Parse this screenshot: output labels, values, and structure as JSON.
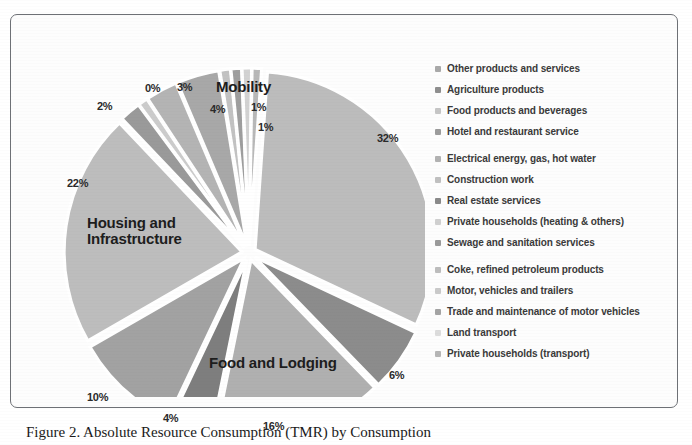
{
  "figure": {
    "caption": "Figure 2. Absolute Resource Consumption (TMR) by Consumption"
  },
  "chart_data": {
    "type": "pie",
    "title": "",
    "exploded": true,
    "center": {
      "x": 224,
      "y": 216
    },
    "radius": 178,
    "labels": [
      "Other products and services",
      "Agriculture products",
      "Food products and beverages",
      "Hotel and restaurant service",
      "Electrical energy, gas, hot water",
      "Construction work",
      "Real estate services",
      "Private households (heating & others)",
      "Sewage and sanitation services",
      "Coke, refined petroleum products",
      "Motor, vehicles and trailers",
      "Trade and maintenance of motor vehicles",
      "Land transport",
      "Private households (transport)"
    ],
    "values": [
      32,
      6,
      16,
      4,
      10,
      22,
      2,
      0,
      3,
      4,
      1,
      1,
      0,
      0
    ],
    "display_percents": [
      "32%",
      "6%",
      "16%",
      "4%",
      "10%",
      "22%",
      "2%",
      "0%",
      "3%",
      "4%",
      "1%",
      "1%"
    ],
    "colors": [
      "#bcbcbc",
      "#8c8c8c",
      "#b0b0b0",
      "#7e7e7e",
      "#a2a2a2",
      "#bdbdbd",
      "#9a9a9a",
      "#cccccc",
      "#b4b4b4",
      "#a8a8a8",
      "#c2c2c2",
      "#9e9e9e",
      "#d2d2d2",
      "#b8b8b8"
    ],
    "group_labels": [
      "Mobility",
      "Housing and Infrastructure",
      "Food and Lodging"
    ],
    "legend_position": "right"
  },
  "pie_labels": [
    {
      "text": "32%",
      "x": 352,
      "y": 95
    },
    {
      "text": "6%",
      "x": 364,
      "y": 332
    },
    {
      "text": "16%",
      "x": 238,
      "y": 383
    },
    {
      "text": "4%",
      "x": 138,
      "y": 375
    },
    {
      "text": "10%",
      "x": 62,
      "y": 354
    },
    {
      "text": "22%",
      "x": 42,
      "y": 140
    },
    {
      "text": "2%",
      "x": 72,
      "y": 63
    },
    {
      "text": "0%",
      "x": 120,
      "y": 45
    },
    {
      "text": "3%",
      "x": 152,
      "y": 44
    },
    {
      "text": "4%",
      "x": 185,
      "y": 66
    },
    {
      "text": "1%",
      "x": 226,
      "y": 64
    },
    {
      "text": "1%",
      "x": 233,
      "y": 84
    }
  ],
  "pie_group_labels": [
    {
      "text": "Mobility",
      "x": 191,
      "y": 42,
      "multiline": false
    },
    {
      "text": "Housing and Infrastructure",
      "x": 62,
      "y": 178,
      "multiline": true
    },
    {
      "text": "Food and Lodging",
      "x": 184,
      "y": 318,
      "multiline": false
    }
  ],
  "legend": {
    "groups": [
      {
        "items": [
          {
            "label": "Other products and services",
            "color": "#a9a9a9"
          },
          {
            "label": "Agriculture products",
            "color": "#8f8f8f"
          },
          {
            "label": "Food products and beverages",
            "color": "#c6c6c6"
          },
          {
            "label": "Hotel and restaurant service",
            "color": "#9c9c9c"
          }
        ]
      },
      {
        "items": [
          {
            "label": "Electrical energy, gas, hot water",
            "color": "#b2b2b2"
          },
          {
            "label": "Construction work",
            "color": "#c0c0c0"
          },
          {
            "label": "Real estate services",
            "color": "#8a8a8a"
          },
          {
            "label": "Private households (heating & others)",
            "color": "#d0d0d0"
          },
          {
            "label": "Sewage and sanitation services",
            "color": "#9a9a9a"
          }
        ]
      },
      {
        "items": [
          {
            "label": "Coke, refined petroleum products",
            "color": "#bdbdbd"
          },
          {
            "label": "Motor, vehicles and trailers",
            "color": "#cacaca"
          },
          {
            "label": "Trade and maintenance of motor vehicles",
            "color": "#a4a4a4"
          },
          {
            "label": "Land transport",
            "color": "#dcdcdc"
          },
          {
            "label": "Private households (transport)",
            "color": "#b6b6b6"
          }
        ]
      }
    ]
  }
}
